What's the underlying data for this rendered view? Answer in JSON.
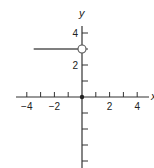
{
  "chart_data": {
    "type": "line",
    "title": "",
    "xlabel": "x",
    "ylabel": "y",
    "xlim": [
      -4.5,
      4.5
    ],
    "ylim": [
      -4.5,
      5
    ],
    "x_ticks": [
      -4,
      -3,
      -2,
      -1,
      1,
      2,
      3,
      4
    ],
    "x_tick_labels": [
      {
        "value": -4,
        "label": "−4"
      },
      {
        "value": -2,
        "label": "−2"
      },
      {
        "value": 2,
        "label": "2"
      },
      {
        "value": 4,
        "label": "4"
      }
    ],
    "y_ticks": [
      4,
      3,
      2,
      1,
      -1,
      -2,
      -3,
      -4
    ],
    "y_tick_labels": [
      {
        "value": 4,
        "label": "4"
      },
      {
        "value": 2,
        "label": "2"
      }
    ],
    "grid": false,
    "series": [
      {
        "name": "f(x) = 3 for x < 0",
        "points": [
          [
            -3.5,
            3
          ],
          [
            0,
            3
          ]
        ],
        "end_marker": {
          "x": 0,
          "y": 3,
          "style": "open-circle"
        }
      }
    ],
    "annotations": [
      {
        "x": 0,
        "y": 0,
        "style": "filled-dot"
      }
    ]
  },
  "axes": {
    "x_label": "x",
    "y_label": "y"
  }
}
